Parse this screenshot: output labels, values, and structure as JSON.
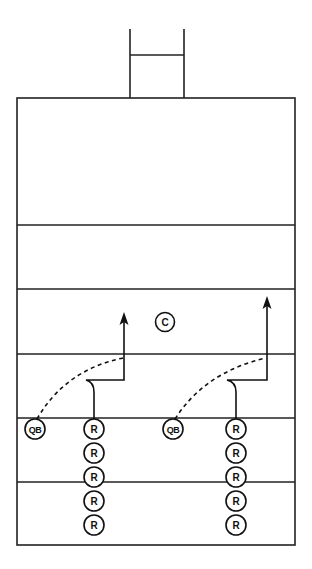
{
  "diagram": {
    "type": "football-drill",
    "field": {
      "border": {
        "x": 17,
        "y": 98,
        "width": 278,
        "height": 447
      },
      "yard_lines_y": [
        225,
        289,
        354,
        418,
        482
      ],
      "goalpost": {
        "left_x": 130,
        "right_x": 184,
        "top_y": 29,
        "crossbar_y": 55,
        "base_y": 98
      }
    },
    "players": {
      "coach": {
        "label": "C",
        "x": 165,
        "y": 322
      },
      "group_left": {
        "qb": {
          "label": "QB",
          "x": 35,
          "y": 429
        },
        "receivers": [
          {
            "label": "R",
            "x": 94,
            "y": 429
          },
          {
            "label": "R",
            "x": 94,
            "y": 453
          },
          {
            "label": "R",
            "x": 94,
            "y": 477
          },
          {
            "label": "R",
            "x": 94,
            "y": 501
          },
          {
            "label": "R",
            "x": 94,
            "y": 525
          }
        ]
      },
      "group_right": {
        "qb": {
          "label": "QB",
          "x": 173,
          "y": 429
        },
        "receivers": [
          {
            "label": "R",
            "x": 236,
            "y": 429
          },
          {
            "label": "R",
            "x": 236,
            "y": 453
          },
          {
            "label": "R",
            "x": 236,
            "y": 477
          },
          {
            "label": "R",
            "x": 236,
            "y": 501
          },
          {
            "label": "R",
            "x": 236,
            "y": 525
          }
        ]
      }
    },
    "routes": [
      {
        "path": "M94 419 L94 392 Q94 382 86 380 L124 380 L124 320",
        "arrow_tip": [
          124,
          312
        ]
      },
      {
        "path": "M236 419 L236 392 Q236 382 227 380 L267 380 L267 304",
        "arrow_tip": [
          267,
          296
        ]
      }
    ],
    "passes": [
      {
        "path": "M37 419 Q65 370 123 358"
      },
      {
        "path": "M175 419 Q205 372 266 358"
      }
    ],
    "colors": {
      "ink": "#111111",
      "background": "#ffffff"
    }
  }
}
